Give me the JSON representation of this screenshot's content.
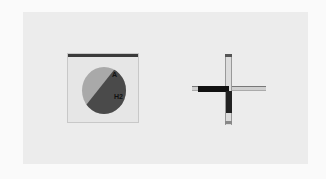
{
  "scene": {
    "description": "Two mechanical indicator symbols on a light panel",
    "left_indicator": {
      "type": "dial-in-square",
      "labels": [
        "A",
        "H2"
      ]
    },
    "right_indicator": {
      "type": "cross"
    },
    "colors": {
      "background": "#fafafa",
      "panel": "#ececec",
      "dark": "#4a4a4a",
      "light": "#a9a9a9"
    }
  }
}
